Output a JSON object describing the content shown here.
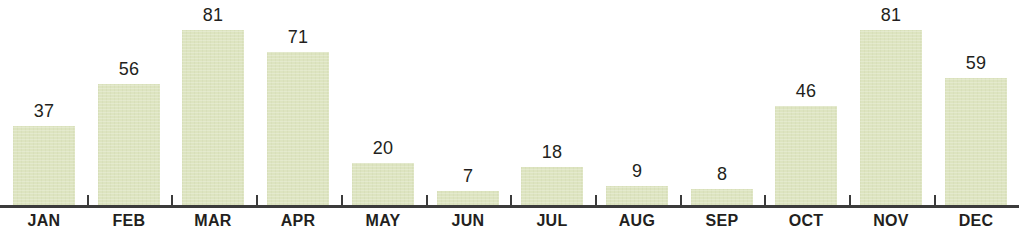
{
  "chart_data": {
    "type": "bar",
    "title": "",
    "subtitle": "",
    "xlabel": "",
    "ylabel": "",
    "categories": [
      "JAN",
      "FEB",
      "MAR",
      "APR",
      "MAY",
      "JUN",
      "JUL",
      "AUG",
      "SEP",
      "OCT",
      "NOV",
      "DEC"
    ],
    "values": [
      37,
      56,
      81,
      71,
      20,
      7,
      18,
      9,
      8,
      46,
      81,
      59
    ],
    "data_labels": [
      "37",
      "56",
      "81",
      "71",
      "20",
      "7",
      "18",
      "9",
      "8",
      "46",
      "81",
      "59"
    ],
    "ylim": [
      0,
      81
    ],
    "grid": false,
    "legend": null,
    "axis_visible": {
      "x": true,
      "y": false
    },
    "annotations": []
  },
  "style": {
    "bar_color": "#dde4c0",
    "axis_color": "#3b3b3b",
    "label_color": "#231f20",
    "background": "#ffffff"
  }
}
